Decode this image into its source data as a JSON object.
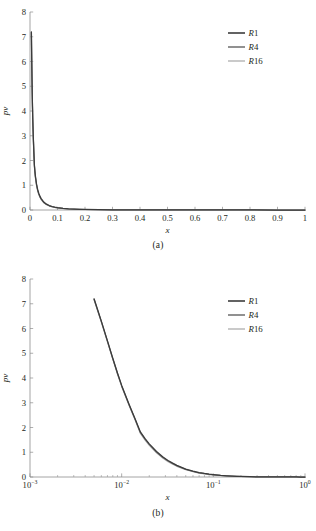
{
  "figure": {
    "panels": [
      {
        "id": "a",
        "caption": "(a)"
      },
      {
        "id": "b",
        "caption": "(b)"
      }
    ]
  },
  "axes": {
    "xlabel": "x",
    "ylabel": "p̃",
    "ylabel_display": "pv"
  },
  "legend": {
    "entries": [
      {
        "label": "R1",
        "color": "#3b3b3b"
      },
      {
        "label": "R4",
        "color": "#757575"
      },
      {
        "label": "R16",
        "color": "#bdbdbd"
      }
    ]
  },
  "colors": {
    "axis": "#8d8d8d",
    "text": "#231f20",
    "background": "#ffffff",
    "r1": "#3b3b3b",
    "r4": "#757575",
    "r16": "#bdbdbd"
  },
  "panel_a_ticks": {
    "x": [
      "0",
      "0.1",
      "0.2",
      "0.3",
      "0.4",
      "0.5",
      "0.6",
      "0.7",
      "0.8",
      "0.9",
      "1"
    ],
    "y": [
      "0",
      "1",
      "2",
      "3",
      "4",
      "5",
      "6",
      "7",
      "8"
    ]
  },
  "panel_b_ticks": {
    "x": [
      {
        "mantissa": "10",
        "exponent": "-3"
      },
      {
        "mantissa": "10",
        "exponent": "-2"
      },
      {
        "mantissa": "10",
        "exponent": "-1"
      },
      {
        "mantissa": "10",
        "exponent": "0"
      }
    ],
    "y": [
      "0",
      "1",
      "2",
      "3",
      "4",
      "5",
      "6",
      "7",
      "8"
    ]
  },
  "chart_data": [
    {
      "type": "line",
      "panel": "a",
      "title": "",
      "xlabel": "x",
      "ylabel": "pv",
      "xscale": "linear",
      "yscale": "linear",
      "xlim": [
        0,
        1
      ],
      "ylim": [
        0,
        8
      ],
      "xticks": [
        0,
        0.1,
        0.2,
        0.3,
        0.4,
        0.5,
        0.6,
        0.7,
        0.8,
        0.9,
        1
      ],
      "yticks": [
        0,
        1,
        2,
        3,
        4,
        5,
        6,
        7,
        8
      ],
      "grid": false,
      "legend_position": "upper right",
      "x": [
        0.005,
        0.006,
        0.007,
        0.008,
        0.009,
        0.01,
        0.012,
        0.014,
        0.016,
        0.018,
        0.02,
        0.024,
        0.028,
        0.032,
        0.036,
        0.04,
        0.05,
        0.06,
        0.07,
        0.08,
        0.09,
        0.1,
        0.12,
        0.14,
        0.16,
        0.18,
        0.2,
        0.25,
        0.3,
        0.4,
        0.5,
        0.6,
        0.7,
        0.8,
        0.9,
        1.0
      ],
      "series": [
        {
          "name": "R1",
          "color": "#3b3b3b",
          "values": [
            7.2,
            6.3,
            5.5,
            4.8,
            4.2,
            3.7,
            2.95,
            2.35,
            1.82,
            1.55,
            1.34,
            1.03,
            0.82,
            0.67,
            0.56,
            0.47,
            0.32,
            0.235,
            0.18,
            0.142,
            0.114,
            0.094,
            0.066,
            0.048,
            0.036,
            0.028,
            0.022,
            0.012,
            0.007,
            0.003,
            0.0015,
            0.0008,
            0.0005,
            0.0003,
            0.0002,
            0.0001
          ]
        },
        {
          "name": "R4",
          "color": "#757575",
          "values": [
            7.18,
            6.28,
            5.48,
            4.78,
            4.18,
            3.68,
            2.93,
            2.33,
            1.79,
            1.52,
            1.31,
            1.0,
            0.79,
            0.645,
            0.535,
            0.45,
            0.305,
            0.222,
            0.17,
            0.133,
            0.107,
            0.088,
            0.061,
            0.044,
            0.033,
            0.026,
            0.02,
            0.011,
            0.006,
            0.0027,
            0.0013,
            0.0007,
            0.0004,
            0.00025,
            0.00015,
            8e-05
          ]
        },
        {
          "name": "R16",
          "color": "#bdbdbd",
          "values": [
            7.16,
            6.26,
            5.46,
            4.76,
            4.16,
            3.66,
            2.91,
            2.31,
            1.76,
            1.49,
            1.28,
            0.975,
            0.765,
            0.622,
            0.515,
            0.432,
            0.292,
            0.212,
            0.161,
            0.126,
            0.101,
            0.083,
            0.057,
            0.041,
            0.03,
            0.024,
            0.018,
            0.01,
            0.0055,
            0.0024,
            0.0012,
            0.0006,
            0.00035,
            0.0002,
            0.00012,
            6e-05
          ]
        }
      ]
    },
    {
      "type": "line",
      "panel": "b",
      "title": "",
      "xlabel": "x",
      "ylabel": "pv",
      "xscale": "log",
      "yscale": "linear",
      "xlim": [
        0.001,
        1
      ],
      "ylim": [
        0,
        8
      ],
      "xticks": [
        0.001,
        0.01,
        0.1,
        1
      ],
      "yticks": [
        0,
        1,
        2,
        3,
        4,
        5,
        6,
        7,
        8
      ],
      "grid": false,
      "legend_position": "upper right",
      "x": [
        0.005,
        0.006,
        0.007,
        0.008,
        0.009,
        0.01,
        0.012,
        0.014,
        0.016,
        0.018,
        0.02,
        0.024,
        0.028,
        0.032,
        0.036,
        0.04,
        0.05,
        0.06,
        0.07,
        0.08,
        0.09,
        0.1,
        0.12,
        0.14,
        0.16,
        0.18,
        0.2,
        0.25,
        0.3,
        0.4,
        0.5,
        0.6,
        0.7,
        0.8,
        0.9,
        1.0
      ],
      "series": [
        {
          "name": "R1",
          "color": "#3b3b3b",
          "values": [
            7.2,
            6.3,
            5.5,
            4.8,
            4.2,
            3.7,
            2.95,
            2.35,
            1.82,
            1.55,
            1.34,
            1.03,
            0.82,
            0.67,
            0.56,
            0.47,
            0.32,
            0.235,
            0.18,
            0.142,
            0.114,
            0.094,
            0.066,
            0.048,
            0.036,
            0.028,
            0.022,
            0.012,
            0.007,
            0.003,
            0.0015,
            0.0008,
            0.0005,
            0.0003,
            0.0002,
            0.0001
          ]
        },
        {
          "name": "R4",
          "color": "#757575",
          "values": [
            7.18,
            6.28,
            5.48,
            4.78,
            4.18,
            3.68,
            2.93,
            2.33,
            1.79,
            1.52,
            1.31,
            1.0,
            0.79,
            0.645,
            0.535,
            0.45,
            0.305,
            0.222,
            0.17,
            0.133,
            0.107,
            0.088,
            0.061,
            0.044,
            0.033,
            0.026,
            0.02,
            0.011,
            0.006,
            0.0027,
            0.0013,
            0.0007,
            0.0004,
            0.00025,
            0.00015,
            8e-05
          ]
        },
        {
          "name": "R16",
          "color": "#bdbdbd",
          "values": [
            7.16,
            6.26,
            5.46,
            4.76,
            4.16,
            3.66,
            2.91,
            2.31,
            1.76,
            1.49,
            1.28,
            0.975,
            0.765,
            0.622,
            0.515,
            0.432,
            0.292,
            0.212,
            0.161,
            0.126,
            0.101,
            0.083,
            0.057,
            0.041,
            0.03,
            0.024,
            0.018,
            0.01,
            0.0055,
            0.0024,
            0.0012,
            0.0006,
            0.00035,
            0.0002,
            0.00012,
            6e-05
          ]
        }
      ]
    }
  ]
}
